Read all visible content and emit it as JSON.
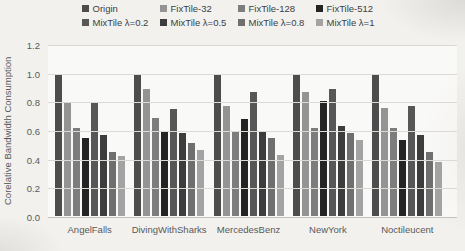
{
  "figure": {
    "background": "#f2f1ee",
    "gridline_color": "#dbdad6",
    "axis_text_color": "#595959"
  },
  "chart_data": {
    "type": "bar",
    "title": "",
    "xlabel": "",
    "ylabel": "Corelative Bandwidth Consumption",
    "ylim": [
      0,
      1.2
    ],
    "ytick_labels": [
      "1.2",
      "1.0",
      "0.8",
      "0.6",
      "0.4",
      "0.2",
      "0.0"
    ],
    "grid": "horizontal",
    "legend_position": "top",
    "legend_rows": 2,
    "categories": [
      "AngelFalls",
      "DivingWithSharks",
      "MercedesBenz",
      "NewYork",
      "Noctileucent"
    ],
    "series": [
      {
        "name": "Origin",
        "color": "#4d4d4d",
        "values": [
          1.0,
          1.0,
          1.0,
          1.0,
          1.0
        ]
      },
      {
        "name": "FixTile-32",
        "color": "#949494",
        "values": [
          0.8,
          0.89,
          0.77,
          0.87,
          0.76
        ]
      },
      {
        "name": "FixTile-128",
        "color": "#7d7d7d",
        "values": [
          0.62,
          0.69,
          0.6,
          0.62,
          0.62
        ]
      },
      {
        "name": "FixTile-512",
        "color": "#242424",
        "values": [
          0.55,
          0.59,
          0.68,
          0.81,
          0.53
        ]
      },
      {
        "name": "MixTile λ=0.2",
        "color": "#575757",
        "values": [
          0.79,
          0.75,
          0.87,
          0.89,
          0.77
        ]
      },
      {
        "name": "MixTile λ=0.5",
        "color": "#3d3d3d",
        "values": [
          0.57,
          0.58,
          0.59,
          0.63,
          0.57
        ]
      },
      {
        "name": "MixTile λ=0.8",
        "color": "#6f6f6f",
        "values": [
          0.45,
          0.51,
          0.55,
          0.58,
          0.45
        ]
      },
      {
        "name": "MixTile λ=1",
        "color": "#a3a3a3",
        "values": [
          0.42,
          0.46,
          0.43,
          0.53,
          0.38
        ]
      }
    ]
  }
}
